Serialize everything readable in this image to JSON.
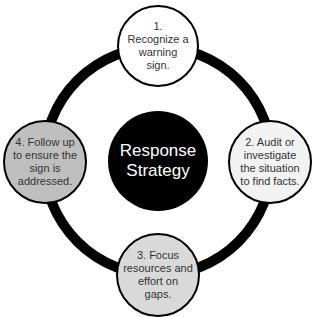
{
  "diagram": {
    "type": "cycle",
    "center": {
      "label": "Response Strategy",
      "line1": "Response",
      "line2": "Strategy",
      "fill": "#000000",
      "text_color": "#ffffff"
    },
    "ring": {
      "color": "#000000"
    },
    "steps": [
      {
        "label": "1. Recognize a warning sign.",
        "fill": "#ffffff",
        "position": "top"
      },
      {
        "label": "2. Audit or investigate the situation to find facts.",
        "fill": "#f2f2f2",
        "position": "right"
      },
      {
        "label": "3. Focus resources and effort on gaps.",
        "fill": "#d9d9d9",
        "position": "bottom"
      },
      {
        "label": "4. Follow up to ensure the sign is addressed.",
        "fill": "#bfbfbf",
        "position": "left"
      }
    ]
  }
}
